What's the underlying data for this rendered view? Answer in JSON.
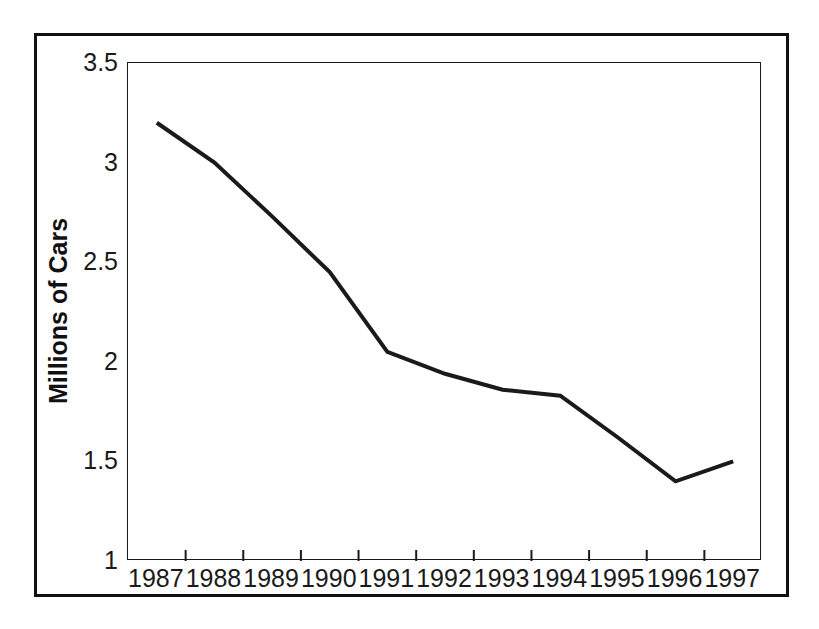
{
  "chart_data": {
    "type": "line",
    "title": "",
    "xlabel": "",
    "ylabel": "Millions of Cars",
    "categories": [
      "1987",
      "1988",
      "1989",
      "1990",
      "1991",
      "1992",
      "1993",
      "1994",
      "1995",
      "1996",
      "1997"
    ],
    "values": [
      3.2,
      3.0,
      2.73,
      2.45,
      2.05,
      1.94,
      1.86,
      1.83,
      1.62,
      1.4,
      1.5
    ],
    "series": [
      {
        "name": "Millions of Cars",
        "values": [
          3.2,
          3.0,
          2.73,
          2.45,
          2.05,
          1.94,
          1.86,
          1.83,
          1.62,
          1.4,
          1.5
        ]
      }
    ],
    "ylim": [
      1,
      3.5
    ],
    "ytick_labels": [
      "3.5",
      "3",
      "2.5",
      "2",
      "1.5",
      "1"
    ],
    "ytick_values": [
      3.5,
      3,
      2.5,
      2,
      1.5,
      1
    ],
    "xtick_labels": [
      "1987",
      "1988",
      "1989",
      "1990",
      "1991",
      "1992",
      "1993",
      "1994",
      "1995",
      "1996",
      "1997"
    ],
    "grid": false,
    "legend": false,
    "legend_position": "none",
    "line_color": "#1a1a1a",
    "line_width": 4,
    "background_color": "#ffffff",
    "frame_color": "#111111",
    "annotations": []
  },
  "ylabels": {
    "t0": "3.5",
    "t1": "3",
    "t2": "2.5",
    "t3": "2",
    "t4": "1.5",
    "t5": "1"
  },
  "xlabels": {
    "t0": "1987",
    "t1": "1988",
    "t2": "1989",
    "t3": "1990",
    "t4": "1991",
    "t5": "1992",
    "t6": "1993",
    "t7": "1994",
    "t8": "1995",
    "t9": "1996",
    "t10": "1997"
  },
  "axis_titles": {
    "y": "Millions of Cars",
    "x": "",
    "main": ""
  }
}
